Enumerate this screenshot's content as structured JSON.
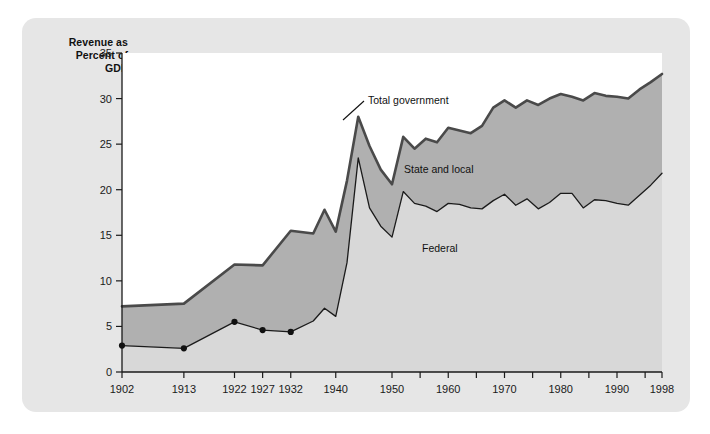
{
  "figure": {
    "panel_bg": "#e6e6e6",
    "plot_bg": "#ffffff",
    "axis_title_line1": "Revenue as",
    "axis_title_line2": "Percent of",
    "axis_title_line3": "GDP"
  },
  "chart_data": {
    "type": "area",
    "title": "",
    "subtitle": "",
    "xlabel": "",
    "ylabel": "Revenue as Percent of GDP",
    "xlim": [
      1902,
      1998
    ],
    "ylim": [
      0,
      35
    ],
    "grid": false,
    "legend_position": "inline-annotations",
    "yticks": [
      0,
      5,
      10,
      15,
      20,
      25,
      30,
      35
    ],
    "xticks": [
      1902,
      1913,
      1922,
      1927,
      1932,
      1940,
      1950,
      1955,
      1960,
      1965,
      1970,
      1975,
      1980,
      1985,
      1990,
      1995,
      1998
    ],
    "xtick_labels": [
      {
        "year": 1902,
        "label": "1902"
      },
      {
        "year": 1913,
        "label": "1913"
      },
      {
        "year": 1922,
        "label": "1922"
      },
      {
        "year": 1927,
        "label": "1927"
      },
      {
        "year": 1932,
        "label": "1932"
      },
      {
        "year": 1940,
        "label": "1940"
      },
      {
        "year": 1950,
        "label": "1950"
      },
      {
        "year": 1960,
        "label": "1960"
      },
      {
        "year": 1970,
        "label": "1970"
      },
      {
        "year": 1980,
        "label": "1980"
      },
      {
        "year": 1990,
        "label": "1990"
      },
      {
        "year": 1998,
        "label": "1998"
      }
    ],
    "colors": {
      "total_line": "#4a4a4a",
      "state_local_fill": "#b0b0b0",
      "federal_fill": "#d8d8d8",
      "federal_line": "#1a1a1a",
      "marker": "#111111"
    },
    "annotations": [
      {
        "name": "total-government",
        "text": "Total government",
        "x_px": 368,
        "y_px": 104,
        "leader": true
      },
      {
        "name": "state-and-local",
        "text": "State and local",
        "x_px": 404,
        "y_px": 173,
        "leader": false
      },
      {
        "name": "federal",
        "text": "Federal",
        "x_px": 422,
        "y_px": 252,
        "leader": false
      }
    ],
    "series": [
      {
        "name": "Total government",
        "x": [
          1902,
          1913,
          1922,
          1927,
          1932,
          1936,
          1938,
          1940,
          1942,
          1944,
          1946,
          1948,
          1950,
          1952,
          1954,
          1956,
          1958,
          1960,
          1962,
          1964,
          1966,
          1968,
          1970,
          1972,
          1974,
          1976,
          1978,
          1980,
          1982,
          1984,
          1986,
          1988,
          1990,
          1992,
          1994,
          1996,
          1998
        ],
        "values": [
          7.2,
          7.5,
          11.8,
          11.7,
          15.5,
          15.2,
          17.8,
          15.4,
          21.0,
          28.0,
          24.8,
          22.2,
          20.6,
          25.8,
          24.5,
          25.6,
          25.2,
          26.8,
          26.5,
          26.2,
          27.0,
          29.0,
          29.8,
          29.0,
          29.8,
          29.3,
          30.0,
          30.5,
          30.2,
          29.8,
          30.6,
          30.3,
          30.2,
          30.0,
          31.0,
          31.8,
          32.7
        ]
      },
      {
        "name": "Federal",
        "x": [
          1902,
          1913,
          1922,
          1927,
          1932,
          1936,
          1938,
          1940,
          1942,
          1944,
          1946,
          1948,
          1950,
          1952,
          1954,
          1956,
          1958,
          1960,
          1962,
          1964,
          1966,
          1968,
          1970,
          1972,
          1974,
          1976,
          1978,
          1980,
          1982,
          1984,
          1986,
          1988,
          1990,
          1992,
          1994,
          1996,
          1998
        ],
        "values": [
          2.9,
          2.6,
          5.5,
          4.6,
          4.4,
          5.6,
          7.0,
          6.1,
          12.0,
          23.5,
          18.0,
          16.0,
          14.8,
          19.8,
          18.5,
          18.2,
          17.6,
          18.5,
          18.4,
          18.0,
          17.9,
          18.8,
          19.5,
          18.3,
          19.0,
          17.9,
          18.6,
          19.6,
          19.6,
          18.0,
          18.9,
          18.8,
          18.5,
          18.3,
          19.4,
          20.5,
          21.8
        ]
      }
    ],
    "markers": [
      {
        "year": 1902,
        "value": 2.9
      },
      {
        "year": 1913,
        "value": 2.6
      },
      {
        "year": 1922,
        "value": 5.5
      },
      {
        "year": 1927,
        "value": 4.6
      },
      {
        "year": 1932,
        "value": 4.4
      }
    ]
  }
}
